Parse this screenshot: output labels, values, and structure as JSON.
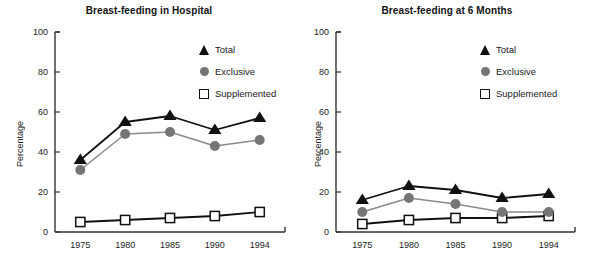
{
  "figure": {
    "background": "#ffffff",
    "width": 597,
    "height": 280
  },
  "colors": {
    "total": "#111111",
    "exclusive": "#757575",
    "supplemented_fill": "#ffffff",
    "supplemented_edge": "#111111",
    "axis": "#333333",
    "text": "#1a1a1a"
  },
  "legend": {
    "items": [
      {
        "label": "Total",
        "marker": "triangle-icon",
        "color": "#111111"
      },
      {
        "label": "Exclusive",
        "marker": "circle-icon",
        "color": "#757575"
      },
      {
        "label": "Supplemented",
        "marker": "square-icon",
        "color": "#ffffff"
      }
    ]
  },
  "axis": {
    "ylabel": "Percentage",
    "yticks": [
      "0",
      "20",
      "40",
      "60",
      "80",
      "100"
    ],
    "xticks": [
      "1975",
      "1980",
      "1985",
      "1990",
      "1994"
    ]
  },
  "chart_data": [
    {
      "type": "line",
      "title": "Breast-feeding in Hospital",
      "xlabel": "",
      "ylabel": "Percentage",
      "categories": [
        "1975",
        "1980",
        "1985",
        "1990",
        "1994"
      ],
      "x": [
        1975,
        1980,
        1985,
        1990,
        1994
      ],
      "ylim": [
        0,
        100
      ],
      "yticks": [
        0,
        20,
        40,
        60,
        80,
        100
      ],
      "grid": false,
      "legend_position": "upper-right",
      "series": [
        {
          "name": "Total",
          "marker": "triangle",
          "color": "#111111",
          "values": [
            36,
            55,
            58,
            51,
            57
          ]
        },
        {
          "name": "Exclusive",
          "marker": "circle",
          "color": "#757575",
          "values": [
            31,
            49,
            50,
            43,
            46
          ]
        },
        {
          "name": "Supplemented",
          "marker": "square",
          "color": "#ffffff",
          "values": [
            5,
            6,
            7,
            8,
            10
          ]
        }
      ]
    },
    {
      "type": "line",
      "title": "Breast-feeding at 6 Months",
      "xlabel": "",
      "ylabel": "Percentage",
      "categories": [
        "1975",
        "1980",
        "1985",
        "1990",
        "1994"
      ],
      "x": [
        1975,
        1980,
        1985,
        1990,
        1994
      ],
      "ylim": [
        0,
        100
      ],
      "yticks": [
        0,
        20,
        40,
        60,
        80,
        100
      ],
      "grid": false,
      "legend_position": "upper-right",
      "series": [
        {
          "name": "Total",
          "marker": "triangle",
          "color": "#111111",
          "values": [
            16,
            23,
            21,
            17,
            19
          ]
        },
        {
          "name": "Exclusive",
          "marker": "circle",
          "color": "#757575",
          "values": [
            10,
            17,
            14,
            10,
            10
          ]
        },
        {
          "name": "Supplemented",
          "marker": "square",
          "color": "#ffffff",
          "values": [
            4,
            6,
            7,
            7,
            8
          ]
        }
      ]
    }
  ]
}
